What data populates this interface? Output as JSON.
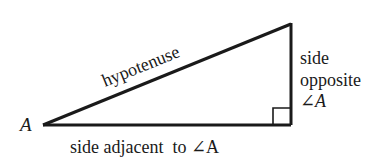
{
  "diagram": {
    "vertex_label": "A",
    "hypotenuse_label": "hypotenuse",
    "opposite_label": {
      "line1": "side",
      "line2": "opposite",
      "line3": "∠A"
    },
    "adjacent_label": "side adjacent  to ∠A",
    "colors": {
      "stroke": "#1a1a1a",
      "background": "#ffffff"
    }
  }
}
